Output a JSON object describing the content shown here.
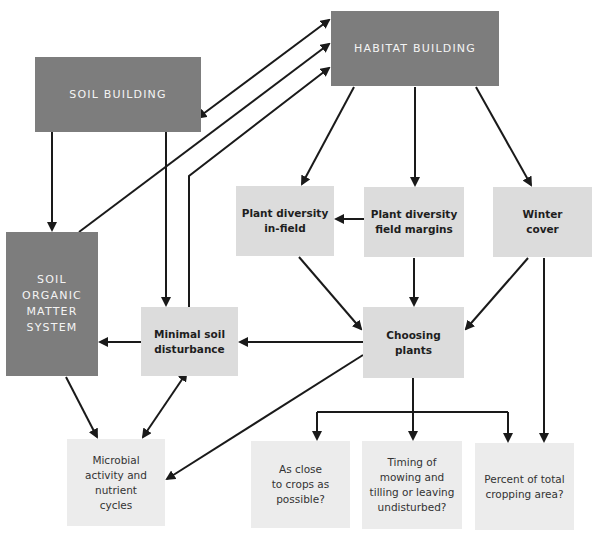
{
  "diagram": {
    "colors": {
      "dark_box": "#7d7d7d",
      "mid_box": "#dcdcdc",
      "light_box": "#ececec",
      "arrow": "#1a1a1a"
    },
    "nodes": {
      "habitat_building": "HABITAT BUILDING",
      "soil_building": "SOIL BUILDING",
      "soil_organic_matter": "SOIL\nORGANIC\nMATTER\nSYSTEM",
      "plant_diversity_infield": "Plant diversity\nin-field",
      "plant_diversity_margins": "Plant diversity\nfield margins",
      "winter_cover": "Winter\ncover",
      "minimal_soil_disturbance": "Minimal soil\ndisturbance",
      "choosing_plants": "Choosing\nplants",
      "microbial_activity": "Microbial\nactivity and\nnutrient\ncycles",
      "as_close_to_crops": "As close\nto crops as\npossible?",
      "timing_of_mowing": "Timing of\nmowing and\ntilling or leaving\nundisturbed?",
      "percent_cropping_area": "Percent of total\ncropping area?"
    },
    "edges": [
      {
        "from": "soil_building",
        "to": "habitat_building",
        "bidirectional": true
      },
      {
        "from": "soil_organic_matter",
        "to": "habitat_building"
      },
      {
        "from": "minimal_soil_disturbance",
        "to": "habitat_building"
      },
      {
        "from": "soil_building",
        "to": "soil_organic_matter"
      },
      {
        "from": "soil_building",
        "to": "minimal_soil_disturbance"
      },
      {
        "from": "habitat_building",
        "to": "plant_diversity_infield"
      },
      {
        "from": "habitat_building",
        "to": "plant_diversity_margins"
      },
      {
        "from": "habitat_building",
        "to": "winter_cover"
      },
      {
        "from": "plant_diversity_margins",
        "to": "plant_diversity_infield"
      },
      {
        "from": "plant_diversity_infield",
        "to": "choosing_plants"
      },
      {
        "from": "plant_diversity_margins",
        "to": "choosing_plants"
      },
      {
        "from": "winter_cover",
        "to": "choosing_plants"
      },
      {
        "from": "choosing_plants",
        "to": "minimal_soil_disturbance"
      },
      {
        "from": "minimal_soil_disturbance",
        "to": "soil_organic_matter"
      },
      {
        "from": "soil_organic_matter",
        "to": "microbial_activity"
      },
      {
        "from": "minimal_soil_disturbance",
        "to": "microbial_activity",
        "bidirectional": true
      },
      {
        "from": "choosing_plants",
        "to": "microbial_activity"
      },
      {
        "from": "choosing_plants",
        "to": "as_close_to_crops"
      },
      {
        "from": "choosing_plants",
        "to": "timing_of_mowing"
      },
      {
        "from": "choosing_plants",
        "to": "percent_cropping_area"
      },
      {
        "from": "winter_cover",
        "to": "percent_cropping_area"
      }
    ]
  }
}
